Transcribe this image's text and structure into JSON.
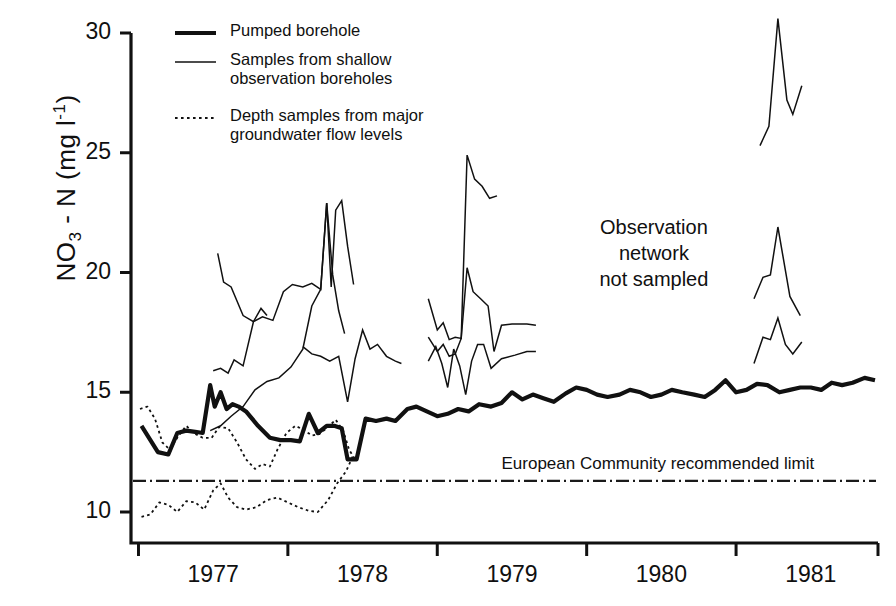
{
  "chart_data": {
    "type": "line",
    "title": "",
    "xlabel": "",
    "ylabel": "NO3 - N  (mg l-1)",
    "ylabel_parts": {
      "species": "NO",
      "sub": "3",
      "dash": " - N",
      "unit_open": "  (mg l",
      "sup": "-1",
      "unit_close": ")"
    },
    "ylim": [
      8.7,
      30.6
    ],
    "yticks": [
      10,
      15,
      20,
      25,
      30
    ],
    "ytick_labels": [
      "10",
      "15",
      "20",
      "25",
      "30"
    ],
    "xlim": [
      1976.45,
      1981.45
    ],
    "xticks": [
      1976.5,
      1977.5,
      1978.5,
      1979.5,
      1980.5,
      1981.45
    ],
    "xtick_labels": [
      "1977",
      "1978",
      "1979",
      "1980",
      "1981"
    ],
    "xtick_label_centers": [
      1977.0,
      1978.0,
      1979.0,
      1980.0,
      1981.0
    ],
    "grid": false,
    "legend_position": "upper-left-inside",
    "series": [
      {
        "name": "Pumped borehole",
        "style": "thick-solid",
        "width": 4.2,
        "color": "#111111",
        "points": [
          [
            1976.52,
            13.6
          ],
          [
            1976.58,
            13.0
          ],
          [
            1976.63,
            12.5
          ],
          [
            1976.7,
            12.4
          ],
          [
            1976.76,
            13.3
          ],
          [
            1976.82,
            13.4
          ],
          [
            1976.88,
            13.35
          ],
          [
            1976.93,
            13.3
          ],
          [
            1976.98,
            15.3
          ],
          [
            1977.01,
            14.4
          ],
          [
            1977.05,
            15.0
          ],
          [
            1977.09,
            14.3
          ],
          [
            1977.13,
            14.5
          ],
          [
            1977.17,
            14.4
          ],
          [
            1977.22,
            14.2
          ],
          [
            1977.3,
            13.6
          ],
          [
            1977.38,
            13.1
          ],
          [
            1977.45,
            13.0
          ],
          [
            1977.52,
            13.0
          ],
          [
            1977.58,
            12.95
          ],
          [
            1977.64,
            14.1
          ],
          [
            1977.7,
            13.3
          ],
          [
            1977.76,
            13.6
          ],
          [
            1977.81,
            13.6
          ],
          [
            1977.86,
            13.5
          ],
          [
            1977.9,
            12.2
          ],
          [
            1977.96,
            12.2
          ],
          [
            1978.02,
            13.9
          ],
          [
            1978.09,
            13.8
          ],
          [
            1978.16,
            13.9
          ],
          [
            1978.22,
            13.8
          ],
          [
            1978.3,
            14.3
          ],
          [
            1978.36,
            14.4
          ],
          [
            1978.43,
            14.2
          ],
          [
            1978.5,
            14.0
          ],
          [
            1978.57,
            14.1
          ],
          [
            1978.64,
            14.3
          ],
          [
            1978.71,
            14.2
          ],
          [
            1978.78,
            14.5
          ],
          [
            1978.86,
            14.4
          ],
          [
            1978.93,
            14.55
          ],
          [
            1979.0,
            15.0
          ],
          [
            1979.07,
            14.7
          ],
          [
            1979.14,
            14.9
          ],
          [
            1979.21,
            14.75
          ],
          [
            1979.28,
            14.6
          ],
          [
            1979.36,
            14.95
          ],
          [
            1979.43,
            15.2
          ],
          [
            1979.5,
            15.1
          ],
          [
            1979.57,
            14.9
          ],
          [
            1979.64,
            14.8
          ],
          [
            1979.72,
            14.9
          ],
          [
            1979.79,
            15.1
          ],
          [
            1979.86,
            15.0
          ],
          [
            1979.93,
            14.8
          ],
          [
            1980.0,
            14.9
          ],
          [
            1980.07,
            15.1
          ],
          [
            1980.14,
            15.0
          ],
          [
            1980.22,
            14.9
          ],
          [
            1980.29,
            14.8
          ],
          [
            1980.36,
            15.1
          ],
          [
            1980.43,
            15.5
          ],
          [
            1980.5,
            15.0
          ],
          [
            1980.57,
            15.1
          ],
          [
            1980.64,
            15.35
          ],
          [
            1980.71,
            15.3
          ],
          [
            1980.79,
            15.0
          ],
          [
            1980.86,
            15.1
          ],
          [
            1980.93,
            15.2
          ],
          [
            1981.0,
            15.2
          ],
          [
            1981.07,
            15.1
          ],
          [
            1981.14,
            15.4
          ],
          [
            1981.21,
            15.3
          ],
          [
            1981.28,
            15.4
          ],
          [
            1981.36,
            15.6
          ],
          [
            1981.43,
            15.5
          ]
        ]
      },
      {
        "name": "Samples from shallow observation boreholes",
        "style": "thin-solid",
        "width": 1.5,
        "color": "#111111",
        "segments": [
          [
            [
              1977.03,
              20.8
            ],
            [
              1977.07,
              19.6
            ],
            [
              1977.12,
              19.4
            ],
            [
              1977.2,
              18.2
            ],
            [
              1977.27,
              17.95
            ],
            [
              1977.32,
              18.5
            ],
            [
              1977.36,
              18.2
            ]
          ],
          [
            [
              1977.0,
              15.9
            ],
            [
              1977.05,
              16.0
            ],
            [
              1977.1,
              15.8
            ],
            [
              1977.14,
              16.35
            ],
            [
              1977.2,
              16.1
            ],
            [
              1977.27,
              17.95
            ],
            [
              1977.33,
              18.15
            ],
            [
              1977.4,
              18.0
            ],
            [
              1977.47,
              19.2
            ],
            [
              1977.53,
              19.5
            ],
            [
              1977.6,
              19.4
            ],
            [
              1977.66,
              19.55
            ],
            [
              1977.72,
              19.3
            ],
            [
              1977.76,
              22.9
            ],
            [
              1977.79,
              19.4
            ],
            [
              1977.82,
              22.6
            ],
            [
              1977.86,
              23.0
            ],
            [
              1977.9,
              21.1
            ],
            [
              1977.94,
              19.5
            ]
          ],
          [
            [
              1976.98,
              13.4
            ],
            [
              1977.05,
              13.6
            ],
            [
              1977.12,
              14.0
            ],
            [
              1977.2,
              14.4
            ],
            [
              1977.28,
              15.1
            ],
            [
              1977.36,
              15.45
            ],
            [
              1977.44,
              15.6
            ],
            [
              1977.52,
              16.05
            ],
            [
              1977.6,
              16.8
            ],
            [
              1977.66,
              18.6
            ],
            [
              1977.72,
              19.3
            ],
            [
              1977.76,
              22.9
            ],
            [
              1977.8,
              19.9
            ],
            [
              1977.84,
              18.4
            ],
            [
              1977.88,
              17.45
            ]
          ],
          [
            [
              1977.6,
              16.9
            ],
            [
              1977.66,
              16.6
            ],
            [
              1977.72,
              16.5
            ],
            [
              1977.78,
              16.3
            ],
            [
              1977.84,
              16.5
            ],
            [
              1977.9,
              14.6
            ],
            [
              1977.95,
              16.4
            ],
            [
              1978.0,
              17.6
            ],
            [
              1978.05,
              16.8
            ],
            [
              1978.1,
              17.0
            ],
            [
              1978.16,
              16.5
            ],
            [
              1978.22,
              16.3
            ],
            [
              1978.26,
              16.2
            ]
          ],
          [
            [
              1978.44,
              18.9
            ],
            [
              1978.5,
              17.6
            ],
            [
              1978.54,
              17.9
            ],
            [
              1978.58,
              17.2
            ],
            [
              1978.62,
              17.3
            ],
            [
              1978.66,
              17.25
            ],
            [
              1978.7,
              24.9
            ],
            [
              1978.75,
              23.9
            ],
            [
              1978.8,
              23.6
            ],
            [
              1978.85,
              23.1
            ],
            [
              1978.9,
              23.2
            ]
          ],
          [
            [
              1978.44,
              17.3
            ],
            [
              1978.5,
              16.7
            ],
            [
              1978.54,
              17.0
            ],
            [
              1978.58,
              16.5
            ],
            [
              1978.62,
              16.6
            ],
            [
              1978.66,
              17.25
            ],
            [
              1978.7,
              20.2
            ],
            [
              1978.74,
              19.2
            ],
            [
              1978.79,
              18.9
            ],
            [
              1978.84,
              18.6
            ],
            [
              1978.88,
              16.7
            ],
            [
              1978.93,
              17.8
            ],
            [
              1979.0,
              17.85
            ],
            [
              1979.1,
              17.85
            ],
            [
              1979.16,
              17.8
            ]
          ],
          [
            [
              1978.44,
              16.3
            ],
            [
              1978.49,
              16.9
            ],
            [
              1978.53,
              16.2
            ],
            [
              1978.57,
              15.2
            ],
            [
              1978.61,
              16.8
            ],
            [
              1978.65,
              16.1
            ],
            [
              1978.69,
              14.9
            ],
            [
              1978.73,
              16.3
            ],
            [
              1978.77,
              17.0
            ],
            [
              1978.81,
              17.0
            ],
            [
              1978.86,
              16.0
            ],
            [
              1978.93,
              16.4
            ],
            [
              1979.02,
              16.55
            ],
            [
              1979.1,
              16.7
            ],
            [
              1979.16,
              16.7
            ]
          ],
          [
            [
              1980.66,
              25.3
            ],
            [
              1980.72,
              26.1
            ],
            [
              1980.78,
              30.6
            ],
            [
              1980.84,
              27.2
            ],
            [
              1980.88,
              26.6
            ],
            [
              1980.94,
              27.8
            ]
          ],
          [
            [
              1980.62,
              18.9
            ],
            [
              1980.68,
              19.8
            ],
            [
              1980.73,
              19.9
            ],
            [
              1980.78,
              21.9
            ],
            [
              1980.86,
              19.0
            ],
            [
              1980.93,
              18.2
            ]
          ],
          [
            [
              1980.62,
              16.2
            ],
            [
              1980.68,
              17.3
            ],
            [
              1980.73,
              17.2
            ],
            [
              1980.78,
              18.1
            ],
            [
              1980.83,
              17.0
            ],
            [
              1980.88,
              16.6
            ],
            [
              1980.94,
              17.1
            ]
          ]
        ]
      },
      {
        "name": "Depth samples from major groundwater flow levels",
        "style": "dotted",
        "width": 1.8,
        "color": "#111111",
        "segments": [
          [
            [
              1976.51,
              14.3
            ],
            [
              1976.56,
              14.4
            ],
            [
              1976.61,
              13.9
            ],
            [
              1976.66,
              12.9
            ],
            [
              1976.71,
              12.6
            ],
            [
              1976.77,
              13.2
            ],
            [
              1976.82,
              13.6
            ],
            [
              1976.87,
              13.3
            ],
            [
              1976.93,
              13.1
            ],
            [
              1976.99,
              13.1
            ],
            [
              1977.04,
              13.55
            ],
            [
              1977.1,
              13.5
            ],
            [
              1977.16,
              12.9
            ],
            [
              1977.22,
              12.2
            ],
            [
              1977.28,
              11.8
            ],
            [
              1977.33,
              12.0
            ],
            [
              1977.38,
              11.9
            ],
            [
              1977.43,
              12.6
            ],
            [
              1977.49,
              13.3
            ],
            [
              1977.55,
              13.6
            ],
            [
              1977.6,
              13.45
            ],
            [
              1977.66,
              13.2
            ],
            [
              1977.71,
              13.25
            ],
            [
              1977.76,
              13.5
            ],
            [
              1977.82,
              13.85
            ],
            [
              1977.87,
              13.4
            ],
            [
              1977.91,
              12.6
            ],
            [
              1977.95,
              12.2
            ]
          ],
          [
            [
              1976.52,
              9.8
            ],
            [
              1976.58,
              9.9
            ],
            [
              1976.64,
              10.4
            ],
            [
              1976.7,
              10.3
            ],
            [
              1976.76,
              10.0
            ],
            [
              1976.82,
              10.45
            ],
            [
              1976.88,
              10.4
            ],
            [
              1976.94,
              10.1
            ],
            [
              1977.0,
              10.9
            ],
            [
              1977.05,
              11.2
            ],
            [
              1977.1,
              10.6
            ],
            [
              1977.16,
              10.2
            ],
            [
              1977.22,
              10.1
            ],
            [
              1977.29,
              10.2
            ],
            [
              1977.36,
              10.5
            ],
            [
              1977.43,
              10.6
            ],
            [
              1977.5,
              10.4
            ],
            [
              1977.57,
              10.2
            ],
            [
              1977.64,
              10.05
            ],
            [
              1977.7,
              10.0
            ],
            [
              1977.77,
              10.5
            ],
            [
              1977.83,
              11.2
            ],
            [
              1977.89,
              11.7
            ],
            [
              1977.94,
              12.4
            ]
          ]
        ]
      }
    ],
    "reference_line": {
      "label": "European Community recommended limit",
      "value": 11.3,
      "style": "dash-dot",
      "color": "#1a1a1a"
    },
    "annotations": [
      {
        "text": "Observation\nnetwork\nnot sampled",
        "x": 1979.95,
        "y": 21.6
      }
    ]
  },
  "legend": {
    "entries": [
      {
        "label": "Pumped borehole",
        "style": "thick-solid"
      },
      {
        "label": "Samples from shallow\nobservation boreholes",
        "style": "thin-solid"
      },
      {
        "label": "Depth samples from major\ngroundwater flow levels",
        "style": "dotted"
      }
    ]
  }
}
